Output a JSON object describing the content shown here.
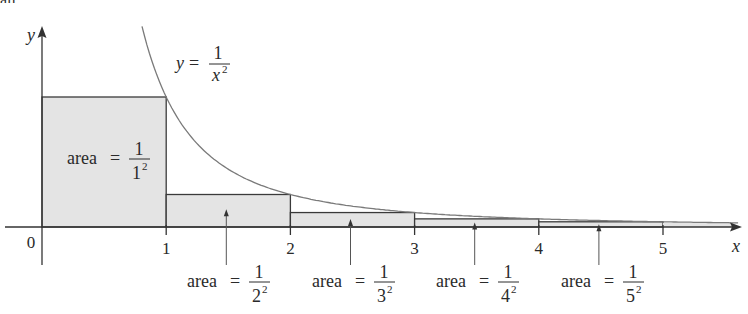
{
  "figure": {
    "clipped_top_text": "all.",
    "colors": {
      "fill": "#e4e4e4",
      "rect_stroke": "#3a3a3a",
      "curve": "#7a7a7a",
      "axis": "#333333",
      "text": "#2a2a2a"
    },
    "axes": {
      "x_label": "x",
      "y_label": "y",
      "origin_label": "0",
      "x_ticks": [
        {
          "value": 1,
          "label": "1"
        },
        {
          "value": 2,
          "label": "2"
        },
        {
          "value": 3,
          "label": "3"
        },
        {
          "value": 4,
          "label": "4"
        },
        {
          "value": 5,
          "label": "5"
        }
      ]
    },
    "curve_label": {
      "lhs": "y",
      "eq": "=",
      "numerator": "1",
      "denominator_base": "x",
      "denominator_exp": "2"
    },
    "rectangles": [
      {
        "x0": 0,
        "x1": 1,
        "height": 1.0,
        "label": {
          "prefix": "area",
          "eq": "=",
          "numerator": "1",
          "base": "1",
          "exp": "2"
        }
      },
      {
        "x0": 1,
        "x1": 2,
        "height": 0.25,
        "label": {
          "prefix": "area",
          "eq": "=",
          "numerator": "1",
          "base": "2",
          "exp": "2"
        }
      },
      {
        "x0": 2,
        "x1": 3,
        "height": 0.1111,
        "label": {
          "prefix": "area",
          "eq": "=",
          "numerator": "1",
          "base": "3",
          "exp": "2"
        }
      },
      {
        "x0": 3,
        "x1": 4,
        "height": 0.0625,
        "label": {
          "prefix": "area",
          "eq": "=",
          "numerator": "1",
          "base": "4",
          "exp": "2"
        }
      },
      {
        "x0": 4,
        "x1": 5,
        "height": 0.04,
        "label": {
          "prefix": "area",
          "eq": "=",
          "numerator": "1",
          "base": "5",
          "exp": "2"
        }
      }
    ]
  }
}
